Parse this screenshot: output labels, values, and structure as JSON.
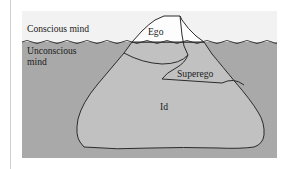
{
  "figure": {
    "background_sky_color": "#f2f2f2",
    "water_color": "#a9a9a9",
    "iceberg_above_color": "#fdfdfd",
    "iceberg_below_color": "#c1c1c1",
    "outline_color": "#2b2b2b",
    "margin_rule_color": "#d2d2d2",
    "labels": {
      "conscious": "Conscious mind",
      "unconscious_line1": "Unconscious",
      "unconscious_line2": "mind",
      "ego": "Ego",
      "superego": "Superego",
      "id": "Id"
    }
  }
}
